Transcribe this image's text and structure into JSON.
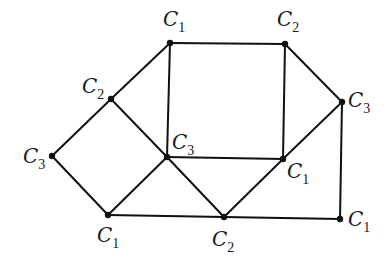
{
  "diagram": {
    "type": "graph-coloring",
    "colors": {
      "edge": "#111111",
      "node": "#111111",
      "label": "#1a1a1a",
      "background": "#ffffff"
    },
    "nodes": [
      {
        "id": "n_top_left",
        "x": 170,
        "y": 43,
        "label": "C",
        "sub": "1",
        "lx": 163,
        "ly": 26
      },
      {
        "id": "n_top_right",
        "x": 285,
        "y": 44,
        "label": "C",
        "sub": "2",
        "lx": 277,
        "ly": 26
      },
      {
        "id": "n_left_upper",
        "x": 111,
        "y": 99,
        "label": "C",
        "sub": "2",
        "lx": 82,
        "ly": 93
      },
      {
        "id": "n_right",
        "x": 342,
        "y": 102,
        "label": "C",
        "sub": "3",
        "lx": 348,
        "ly": 107
      },
      {
        "id": "n_far_left",
        "x": 52,
        "y": 156,
        "label": "C",
        "sub": "3",
        "lx": 23,
        "ly": 163
      },
      {
        "id": "n_center",
        "x": 167,
        "y": 157,
        "label": "C",
        "sub": "3",
        "lx": 172,
        "ly": 149
      },
      {
        "id": "n_mid_right",
        "x": 283,
        "y": 159,
        "label": "C",
        "sub": "1",
        "lx": 287,
        "ly": 178
      },
      {
        "id": "n_bot_left",
        "x": 108,
        "y": 215,
        "label": "C",
        "sub": "1",
        "lx": 97,
        "ly": 242
      },
      {
        "id": "n_bot_mid",
        "x": 224,
        "y": 217,
        "label": "C",
        "sub": "2",
        "lx": 212,
        "ly": 246
      },
      {
        "id": "n_bot_right",
        "x": 340,
        "y": 219,
        "label": "C",
        "sub": "1",
        "lx": 348,
        "ly": 226
      }
    ],
    "edges": [
      [
        "n_top_left",
        "n_top_right"
      ],
      [
        "n_top_left",
        "n_center"
      ],
      [
        "n_top_left",
        "n_left_upper"
      ],
      [
        "n_top_right",
        "n_mid_right"
      ],
      [
        "n_top_right",
        "n_right"
      ],
      [
        "n_left_upper",
        "n_far_left"
      ],
      [
        "n_left_upper",
        "n_center"
      ],
      [
        "n_far_left",
        "n_bot_left"
      ],
      [
        "n_bot_left",
        "n_center"
      ],
      [
        "n_center",
        "n_mid_right"
      ],
      [
        "n_center",
        "n_bot_mid"
      ],
      [
        "n_mid_right",
        "n_right"
      ],
      [
        "n_mid_right",
        "n_bot_mid"
      ],
      [
        "n_right",
        "n_bot_right"
      ],
      [
        "n_bot_left",
        "n_bot_mid"
      ],
      [
        "n_bot_mid",
        "n_bot_right"
      ]
    ]
  }
}
